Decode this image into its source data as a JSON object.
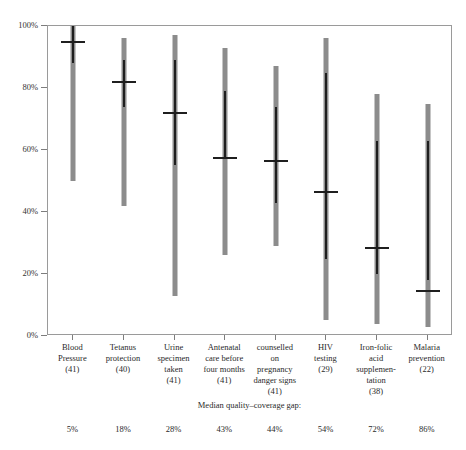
{
  "chart_data": {
    "type": "bar",
    "title": "",
    "subtitle": "",
    "xlabel": "",
    "ylabel": "",
    "ylim": [
      0,
      100
    ],
    "grid": false,
    "legend_position": "none",
    "y_tick_labels": [
      "0%",
      "20%",
      "40%",
      "60%",
      "80%",
      "100%"
    ],
    "y_tick_values": [
      0,
      20,
      40,
      60,
      80,
      100
    ],
    "categories": [
      "Blood Pressure",
      "Tetanus protection",
      "Urine specimen taken",
      "Antenatal care before four months",
      "counselled on pregnancy danger signs",
      "HIV testing",
      "Iron-folic acid supplementation",
      "Malaria prevention"
    ],
    "category_lines": [
      [
        "Blood",
        "Pressure",
        "(41)"
      ],
      [
        "Tetanus",
        "protection",
        "(40)"
      ],
      [
        "Urine",
        "specimen",
        "taken",
        "(41)"
      ],
      [
        "Antenatal",
        "care before",
        "four months",
        "(41)"
      ],
      [
        "counselled",
        "on",
        "pregnancy",
        "danger signs",
        "(41)"
      ],
      [
        "HIV",
        "testing",
        "(29)"
      ],
      [
        "Iron-folic",
        "acid",
        "supplemen-",
        "tation",
        "(38)"
      ],
      [
        "Malaria",
        "prevention",
        "(22)"
      ]
    ],
    "counts": [
      41,
      40,
      41,
      41,
      41,
      29,
      38,
      22
    ],
    "series": [
      {
        "name": "full range",
        "low": [
          50,
          42,
          13,
          26,
          29,
          5,
          4,
          3
        ],
        "high": [
          100,
          96,
          97,
          93,
          87,
          96,
          78,
          75
        ]
      },
      {
        "name": "interquartile range",
        "low": [
          88,
          74,
          55,
          57,
          43,
          25,
          20,
          18
        ],
        "high": [
          100,
          89,
          89,
          79,
          74,
          85,
          63,
          63
        ]
      }
    ],
    "medians": [
      95,
      82,
      72,
      57.5,
      56.5,
      46.5,
      28.5,
      14.5
    ],
    "caption": "Median quality–coverage gap:",
    "gap_values": [
      "5%",
      "18%",
      "28%",
      "43%",
      "44%",
      "54%",
      "72%",
      "86%"
    ],
    "colors": {
      "range_bar": "#8c8c8c",
      "iqr_bar": "#1f1f1f",
      "median_tick": "#1f1f1f",
      "axis": "#9a9a9a",
      "text": "#2a2a2a",
      "background": "#ffffff"
    }
  }
}
